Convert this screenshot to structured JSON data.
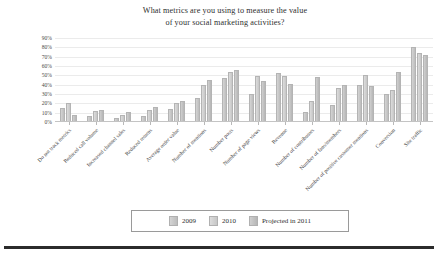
{
  "chart_data": {
    "type": "bar",
    "title": "What metrics are you using to measure the value of your social marketing activities?",
    "title_line1": "What metrics are you using to measure the value",
    "title_line2": "of your social marketing activities?",
    "xlabel": "",
    "ylabel": "",
    "ylim": [
      0,
      90
    ],
    "ytick_labels": [
      "90%",
      "80%",
      "70%",
      "60%",
      "50%",
      "40%",
      "30%",
      "20%",
      "10%",
      "0%"
    ],
    "ytick_values": [
      90,
      80,
      70,
      60,
      50,
      40,
      30,
      20,
      10,
      0
    ],
    "grid": true,
    "legend_position": "bottom",
    "categories": [
      "Do not track metrics",
      "Reduced call volume",
      "Increased channel sales",
      "Reduced returns",
      "Average order value",
      "Number of mentions",
      "Number posts",
      "Number of page views",
      "Revenue",
      "Number of contributors",
      "Number of fans/members",
      "Number of positive customer mentions",
      "Conversion",
      "Site traffic"
    ],
    "series": [
      {
        "name": "2009",
        "color": "#cccccc",
        "values": [
          15,
          6,
          4,
          6,
          14,
          26,
          47,
          30,
          52,
          11,
          18,
          40,
          30,
          80
        ]
      },
      {
        "name": "2010",
        "color": "#dadada",
        "values": [
          20,
          12,
          7,
          13,
          20,
          40,
          54,
          49,
          49,
          22,
          36,
          50,
          34,
          74
        ]
      },
      {
        "name": "Projected in 2011",
        "color": "#c4c4c4",
        "values": [
          8,
          13,
          11,
          16,
          22,
          45,
          56,
          44,
          41,
          48,
          40,
          39,
          54,
          72
        ]
      }
    ]
  },
  "legend": {
    "items": [
      {
        "label": "2009"
      },
      {
        "label": "2010"
      },
      {
        "label": "Projected in 2011"
      }
    ]
  }
}
